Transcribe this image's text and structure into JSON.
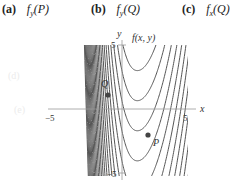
{
  "choices": [
    {
      "tag": "(a)",
      "expr": "f_y(P)",
      "display": "fy(P)"
    },
    {
      "tag": "(b)",
      "expr": "f_y(Q)",
      "display": "fy(Q)"
    },
    {
      "tag": "(c)",
      "expr": "f_x(Q)",
      "display": "fx(Q)"
    }
  ],
  "ghost_labels": [
    "(d)",
    "(e)"
  ],
  "plot": {
    "title": "f(x, y)",
    "x_axis_label": "x",
    "y_axis_label": "y",
    "x_ticks": {
      "neg": "−5",
      "pos": "5"
    },
    "y_ticks": {
      "neg": "−5",
      "pos": "5"
    },
    "points": [
      {
        "name": "Q",
        "x": -1.1,
        "y": 1.1
      },
      {
        "name": "P",
        "x": 2.0,
        "y": -2.0
      }
    ],
    "line_color": "#555555",
    "axis_color": "#999999"
  },
  "chart_data": {
    "type": "contour",
    "title": "f(x, y)",
    "xlabel": "x",
    "ylabel": "y",
    "xlim": [
      -5.3,
      5.2
    ],
    "ylim": [
      -5.3,
      5.1
    ],
    "x_tick_labels": [
      "−5",
      "5"
    ],
    "y_tick_labels": [
      "−5",
      "5"
    ],
    "contour_vertex_x": 1.2,
    "contour_levels": [
      9.8,
      7.5,
      5.3,
      3.0,
      0.65,
      -1.7,
      -4.05,
      -6.4,
      -8.7,
      -11.0,
      -13.3,
      -15.6,
      -17.9,
      -20.2,
      -22.5,
      -24.8,
      -27.1,
      -29.4,
      -31.7,
      -34.0,
      -36.3,
      -38.6,
      -40.9,
      -43.2,
      -45.5,
      -47.8,
      -50.1
    ],
    "points": [
      {
        "label": "Q",
        "x": -1.1,
        "y": 1.1
      },
      {
        "label": "P",
        "x": 2.0,
        "y": -2.0
      }
    ]
  }
}
